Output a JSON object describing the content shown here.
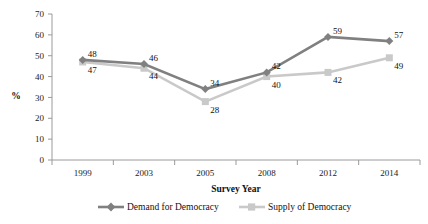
{
  "chart_data": {
    "type": "line",
    "title": "",
    "xlabel": "Survey Year",
    "ylabel": "%",
    "categories": [
      "1999",
      "2003",
      "2005",
      "2008",
      "2012",
      "2014"
    ],
    "ylim": [
      0,
      70
    ],
    "yticks": [
      "0",
      "10",
      "20",
      "30",
      "40",
      "50",
      "60",
      "70"
    ],
    "grid": false,
    "legend_position": "bottom",
    "series": [
      {
        "name": "Demand for Democracy",
        "color": "#808080",
        "marker": "diamond",
        "values": [
          48,
          46,
          34,
          42,
          59,
          57
        ],
        "labels": [
          "48",
          "46",
          "34",
          "42",
          "59",
          "57"
        ]
      },
      {
        "name": "Supply of Democracy",
        "color": "#c9c9c9",
        "marker": "square",
        "values": [
          47,
          44,
          28,
          40,
          42,
          49
        ],
        "labels": [
          "47",
          "44",
          "28",
          "40",
          "42",
          "49"
        ]
      }
    ]
  },
  "legend": {
    "items": [
      {
        "label": "Demand for Democracy"
      },
      {
        "label": "Supply of Democracy"
      }
    ]
  }
}
